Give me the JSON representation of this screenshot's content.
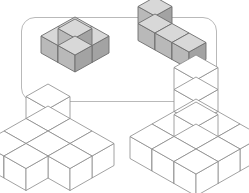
{
  "canvas": {
    "width": 249,
    "height": 193,
    "background": "#ffffff"
  },
  "panel": {
    "name": "prompt-panel",
    "x": 21,
    "y": 17,
    "width": 196,
    "height": 85,
    "radius": 14,
    "border_color": "#b9b9b9",
    "border_width": 1.2,
    "fill": "#ffffff"
  },
  "style": {
    "shaded": {
      "top": "#d8d8d8",
      "left": "#b9b9b9",
      "right": "#a3a3a3",
      "stroke": "#6e6e6e",
      "stroke_width": 0.9
    },
    "outline": {
      "top": "#ffffff",
      "left": "#ffffff",
      "right": "#ffffff",
      "stroke": "#8a8a8a",
      "stroke_width": 0.8
    }
  },
  "figures": [
    {
      "name": "prompt-figure-left",
      "label": "shaded-cube-assembly-a",
      "style": "shaded",
      "origin_x": 75,
      "origin_y": 36,
      "cube_w": 17,
      "cube_h": 9.5,
      "cube_v": 17,
      "cubes": [
        [
          0,
          0,
          0
        ],
        [
          1,
          0,
          0
        ],
        [
          0,
          1,
          0
        ],
        [
          1,
          1,
          0
        ],
        [
          1,
          1,
          1
        ]
      ]
    },
    {
      "name": "prompt-figure-right",
      "label": "shaded-cube-assembly-b",
      "style": "shaded",
      "origin_x": 155,
      "origin_y": 33,
      "cube_w": 17,
      "cube_h": 9.5,
      "cube_v": 17,
      "cubes": [
        [
          0,
          0,
          0
        ],
        [
          1,
          0,
          0
        ],
        [
          2,
          0,
          0
        ],
        [
          0,
          0,
          1
        ]
      ]
    },
    {
      "name": "answer-figure-left",
      "label": "outline-cube-assembly-c",
      "style": "outline",
      "origin_x": 48,
      "origin_y": 131,
      "cube_w": 22,
      "cube_h": 12.5,
      "cube_v": 22,
      "cubes": [
        [
          0,
          0,
          0
        ],
        [
          1,
          0,
          0
        ],
        [
          2,
          0,
          0
        ],
        [
          0,
          1,
          0
        ],
        [
          1,
          1,
          0
        ],
        [
          2,
          1,
          0
        ],
        [
          0,
          2,
          0
        ],
        [
          1,
          2,
          0
        ],
        [
          0,
          0,
          1
        ]
      ]
    },
    {
      "name": "answer-figure-right",
      "label": "outline-cube-assembly-d",
      "style": "outline",
      "origin_x": 196,
      "origin_y": 124,
      "cube_w": 22,
      "cube_h": 12.5,
      "cube_v": 22,
      "cubes": [
        [
          0,
          0,
          0
        ],
        [
          1,
          0,
          0
        ],
        [
          2,
          0,
          0
        ],
        [
          0,
          1,
          0
        ],
        [
          1,
          1,
          0
        ],
        [
          2,
          1,
          0
        ],
        [
          0,
          2,
          0
        ],
        [
          1,
          2,
          0
        ],
        [
          2,
          2,
          0
        ],
        [
          0,
          0,
          1
        ],
        [
          1,
          1,
          1
        ],
        [
          0,
          0,
          2
        ]
      ]
    }
  ]
}
